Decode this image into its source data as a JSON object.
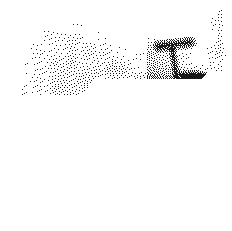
{
  "image": {
    "title": "Dithered grayscale photograph",
    "description": "Heavily dithered / halftone black-and-white photograph of a wall-mounted mechanical bracket assembly",
    "width_px": 232,
    "height_px": 231,
    "rendering": "floyd-steinberg-style stipple dither",
    "background_color": "#ffffff",
    "ink_color": "#1a1a1a"
  },
  "palette": {
    "paper_white": "#ffffff",
    "light_grey": "#ededed",
    "mid_grey": "#b9b9b9",
    "panel_grey": "#c9c9c9",
    "dark_grey": "#4a4a4a",
    "near_black": "#2c2c2c"
  },
  "regions": [
    {
      "name": "background-wall",
      "label": "Background wall",
      "tone": "white",
      "density": 0.04,
      "note": "Largely blank paper-white field occupying the left and lower-left of the frame"
    },
    {
      "name": "left-soft-form",
      "label": "Soft light form, upper left",
      "tone": "light",
      "density": 0.1
    },
    {
      "name": "grey-mass",
      "label": "Central mottled grey mass",
      "tone": "mid",
      "density": 0.42
    },
    {
      "name": "upper-right-panel",
      "label": "Upper right panel surface",
      "tone": "mid",
      "density": 0.34
    },
    {
      "name": "diagonal-beam",
      "label": "Dark diagonal beam",
      "tone": "dark",
      "density": 0.8
    },
    {
      "name": "t-bracket-head",
      "label": "T-shaped bracket head",
      "tone": "near-black",
      "density": 0.9
    },
    {
      "name": "t-bracket-stem",
      "label": "Bracket stem",
      "tone": "dark",
      "density": 0.78
    },
    {
      "name": "curved-arc",
      "label": "Curved dark arc / hook",
      "tone": "dark",
      "density": 0.82
    },
    {
      "name": "lower-stem",
      "label": "Lower vertical strut",
      "tone": "mid-dark",
      "density": 0.55
    },
    {
      "name": "white-floor",
      "label": "Blown-out white floor area",
      "tone": "white",
      "density": 0.05
    }
  ]
}
